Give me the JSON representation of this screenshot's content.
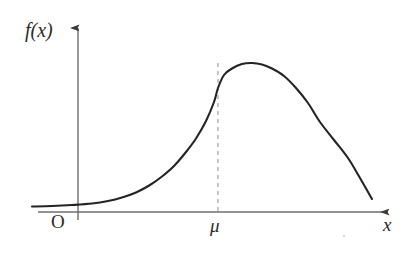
{
  "figure": {
    "kind": "normal-distribution-bell-curve",
    "background_color": "#ffffff",
    "labels": {
      "y_axis": "f(x)",
      "x_axis": "x",
      "origin": "O",
      "mean_tick": "μ"
    },
    "colors": {
      "curve": "#242424",
      "axis": "#6e6e6e",
      "dashed_guide": "#9a9a9a",
      "text": "#2b2b2b"
    }
  },
  "chart_data": {
    "type": "line",
    "title": "",
    "xlabel": "x",
    "ylabel": "f(x)",
    "legend": [],
    "grid": false,
    "annotations": [
      {
        "name": "origin-label",
        "text": "O",
        "x": 0,
        "y": 0
      },
      {
        "name": "mean-label",
        "text": "μ",
        "x": 218,
        "y": 0
      },
      {
        "name": "mean-guide-line",
        "style": "dashed",
        "from": [
          218,
          63
        ],
        "to": [
          218,
          212
        ]
      }
    ],
    "axis_ranges": {
      "x_axis_pixels": [
        38,
        392
      ],
      "y_axis_pixels": [
        220,
        22
      ],
      "baseline_y_pixel": 212
    },
    "series": [
      {
        "name": "f(x)",
        "description": "Gaussian probability density curve, symmetric about the mean μ",
        "peak": {
          "x": 218,
          "y": 63
        },
        "x": [
          32,
          52,
          72,
          92,
          108,
          122,
          136,
          150,
          162,
          174,
          186,
          196,
          206,
          214,
          218,
          224,
          232,
          242,
          252,
          262,
          272,
          284,
          296,
          308,
          320,
          334,
          348,
          360,
          372
        ],
        "y": [
          206.5,
          206,
          205,
          203.5,
          201,
          197.5,
          192.5,
          185,
          176.5,
          166,
          152,
          138.5,
          121,
          102,
          88,
          75,
          68.5,
          64,
          63,
          64.5,
          68.5,
          76,
          88,
          103,
          122,
          140,
          158,
          178,
          199
        ]
      }
    ]
  }
}
